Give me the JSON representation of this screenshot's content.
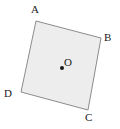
{
  "figure": {
    "type": "tilted-square-with-center-point",
    "background_color": "#ffffff",
    "shape": {
      "name": "quadrilateral-ABCD",
      "fill_color": "#ededed",
      "stroke_color": "#8c8c8c",
      "stroke_width": 1,
      "vertices": [
        {
          "id": "A",
          "x": 36,
          "y": 21
        },
        {
          "id": "B",
          "x": 101,
          "y": 38
        },
        {
          "id": "C",
          "x": 88,
          "y": 110
        },
        {
          "id": "D",
          "x": 21,
          "y": 92
        }
      ]
    },
    "center_point": {
      "id": "O",
      "x": 62,
      "y": 68,
      "radius": 2,
      "color": "#1a1a1a"
    },
    "labels": {
      "a": "A",
      "b": "B",
      "c": "C",
      "d": "D",
      "o": "O"
    }
  }
}
